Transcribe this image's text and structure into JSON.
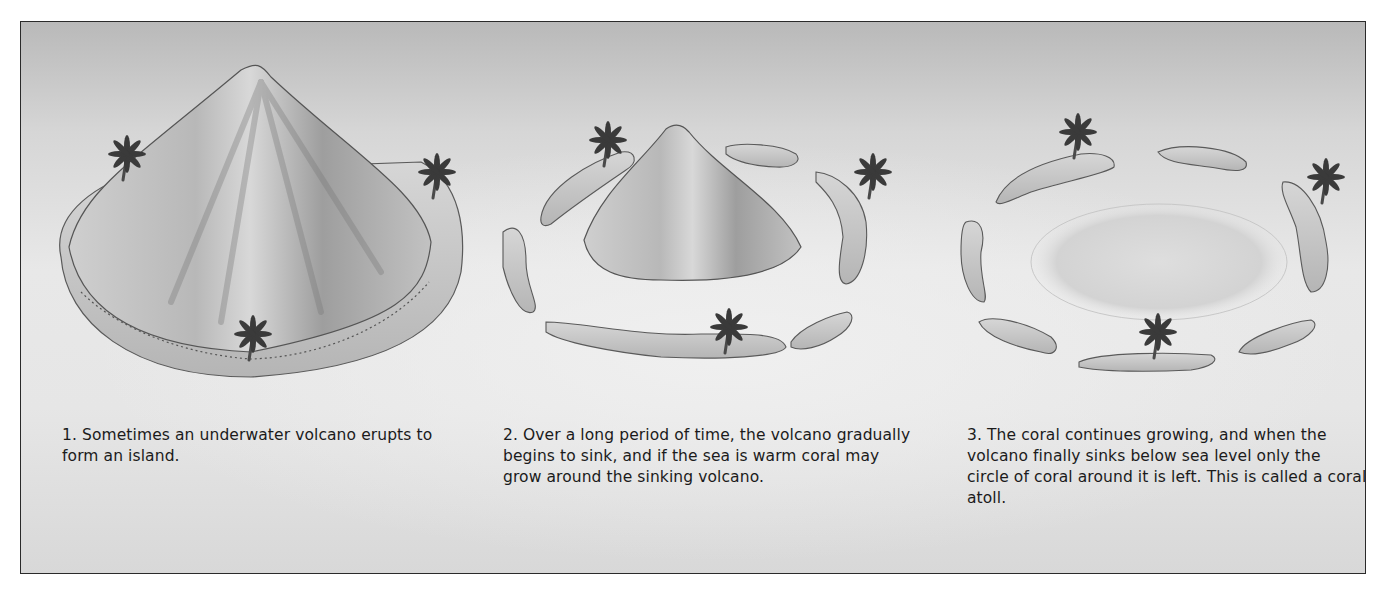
{
  "diagram": {
    "topic": "Formation of a coral atoll",
    "panels": [
      {
        "step": 1,
        "illustration": "volcanic-island",
        "caption": "1. Sometimes an underwater volcano erupts to form an island."
      },
      {
        "step": 2,
        "illustration": "sinking-volcano-with-coral-ring",
        "caption": "2. Over a long period of time, the volcano gradually begins to sink, and if the sea is warm coral may grow around the sinking volcano."
      },
      {
        "step": 3,
        "illustration": "coral-atoll-with-lagoon",
        "caption": "3. The coral continues growing, and when the volcano finally sinks below sea level only the circle of coral around it is left. This is called a coral atoll."
      }
    ],
    "colors": {
      "frame_border": "#2a2a2a",
      "background_top": "#b9b9b9",
      "background_mid": "#e8e8e8",
      "land": "#c4c4c4",
      "palm": "#3a3a3a",
      "text": "#1b1b1b"
    }
  }
}
